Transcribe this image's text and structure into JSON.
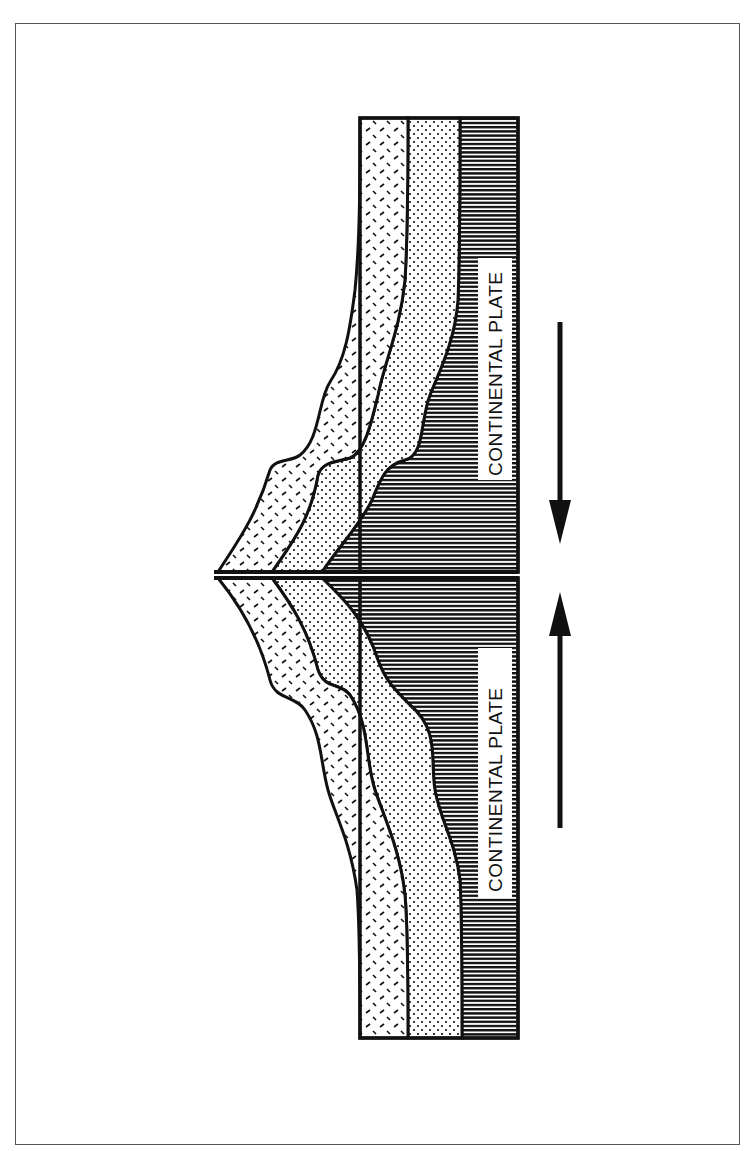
{
  "diagram": {
    "type": "geologic-cross-section",
    "labels": {
      "upper_plate": "CONTINENTAL PLATE",
      "lower_plate": "CONTINENTAL PLATE"
    },
    "layers": [
      {
        "name": "upper-crust",
        "pattern": "dash-hatch"
      },
      {
        "name": "middle-layer",
        "pattern": "stipple-dots"
      },
      {
        "name": "lower-plate-body",
        "pattern": "horizontal-lines"
      }
    ],
    "arrows": [
      {
        "name": "arrow-down",
        "direction": "down",
        "meaning": "upper plate moving toward boundary"
      },
      {
        "name": "arrow-up",
        "direction": "up",
        "meaning": "lower plate moving toward boundary"
      }
    ],
    "colors": {
      "ink": "#111111",
      "paper": "#ffffff",
      "frame": "#555555"
    }
  }
}
